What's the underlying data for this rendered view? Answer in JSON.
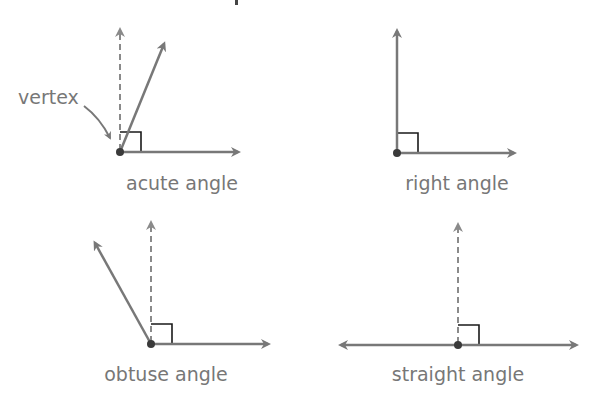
{
  "diagram": {
    "colors": {
      "ray": "#787878",
      "dashed": "#8a8a8a",
      "square": "#1a1a1a",
      "vertex": "#3a3a3a",
      "text": "#777777"
    },
    "panels": [
      {
        "id": "acute",
        "label": "acute angle",
        "vertex": [
          120,
          152
        ],
        "rays": [
          [
            166,
            40
          ],
          [
            242,
            152
          ]
        ],
        "dashed": [
          120,
          25
        ],
        "square_size": 20
      },
      {
        "id": "right",
        "label": "right angle",
        "vertex": [
          397,
          153
        ],
        "rays": [
          [
            397,
            27
          ],
          [
            518,
            153
          ]
        ],
        "square_size": 20
      },
      {
        "id": "obtuse",
        "label": "obtuse angle",
        "vertex": [
          151,
          344
        ],
        "rays": [
          [
            93,
            239
          ],
          [
            272,
            344
          ]
        ],
        "dashed": [
          151,
          218
        ],
        "square_size": 20
      },
      {
        "id": "straight",
        "label": "straight angle",
        "vertex": [
          458,
          345
        ],
        "rays": [
          [
            337,
            345
          ],
          [
            580,
            345
          ]
        ],
        "dashed": [
          458,
          220
        ],
        "square_size": 20
      }
    ],
    "annotation": {
      "label": "vertex",
      "points_to": "acute-vertex"
    }
  }
}
